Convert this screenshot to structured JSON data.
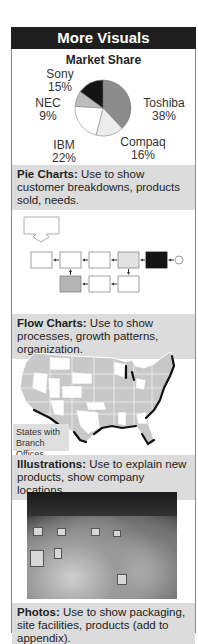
{
  "header": {
    "title": "More Visuals"
  },
  "pie_section": {
    "caption_bold": "Pie Charts:",
    "caption_text": " Use to show customer breakdowns, products sold, needs."
  },
  "flow_section": {
    "caption_bold": "Flow Charts:",
    "caption_text": " Use to show processes, growth patterns, organization."
  },
  "map_section": {
    "legend": "States with Branch Offices",
    "caption_bold": "Illustrations:",
    "caption_text": " Use to explain new products, show company locations."
  },
  "photo_section": {
    "caption_bold": "Photos:",
    "caption_text": " Use to show packaging, site facilities, products (add to appendix)."
  },
  "chart_data": {
    "type": "pie",
    "title": "Market Share",
    "categories": [
      "Toshiba",
      "Compaq",
      "IBM",
      "NEC",
      "Sony"
    ],
    "values": [
      38,
      16,
      22,
      9,
      15
    ],
    "labels": [
      "Toshiba 38%",
      "Compaq 16%",
      "IBM 22%",
      "NEC 9%",
      "Sony 15%"
    ],
    "colors": [
      "#8c8c8c",
      "#ececec",
      "#ffffff",
      "#bdbdbd",
      "#141414"
    ],
    "start_angle": "12 o'clock, clockwise"
  },
  "pie_labels": [
    {
      "name": "Sony",
      "pct": "15%"
    },
    {
      "name": "NEC",
      "pct": "9%"
    },
    {
      "name": "IBM",
      "pct": "22%"
    },
    {
      "name": "Toshiba",
      "pct": "38%"
    },
    {
      "name": "Compaq",
      "pct": "16%"
    }
  ]
}
